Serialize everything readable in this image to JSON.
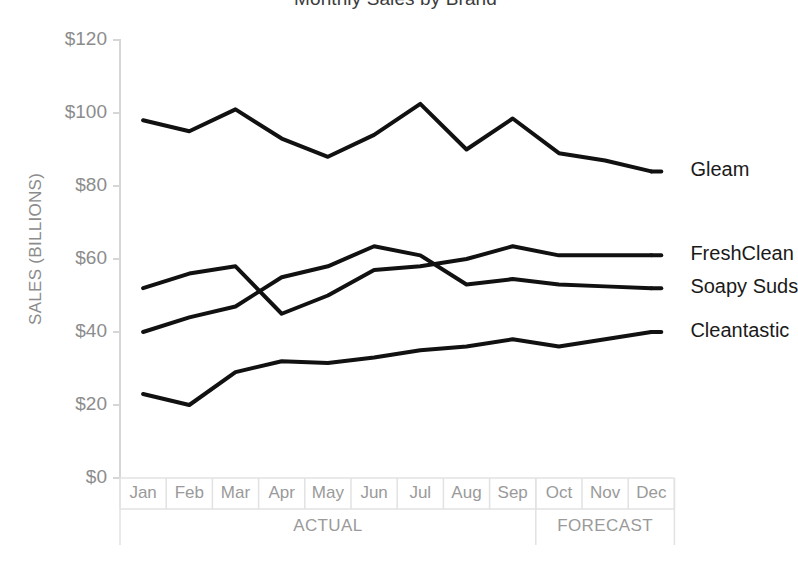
{
  "chart_data": {
    "type": "line",
    "title": "Monthly Sales by Brand",
    "xlabel": "",
    "ylabel": "SALES (BILLIONS)",
    "ylim": [
      0,
      120
    ],
    "ytick_labels": [
      "$0",
      "$20",
      "$40",
      "$60",
      "$80",
      "$100",
      "$120"
    ],
    "ytick_values": [
      0,
      20,
      40,
      60,
      80,
      100,
      120
    ],
    "grid": false,
    "legend_position": "right-inline",
    "categories": [
      "Jan",
      "Feb",
      "Mar",
      "Apr",
      "May",
      "Jun",
      "Jul",
      "Aug",
      "Sep",
      "Oct",
      "Nov",
      "Dec"
    ],
    "groups": [
      {
        "label": "ACTUAL",
        "start": 0,
        "end": 8
      },
      {
        "label": "FORECAST",
        "start": 9,
        "end": 11
      }
    ],
    "series": [
      {
        "name": "Gleam",
        "values": [
          98,
          95,
          101,
          93,
          88,
          94,
          102.5,
          90,
          98.5,
          89,
          87,
          84
        ]
      },
      {
        "name": "FreshClean",
        "values": [
          52,
          56,
          58,
          45,
          50,
          57,
          58,
          60,
          63.5,
          61,
          61,
          61
        ]
      },
      {
        "name": "Soapy Suds",
        "values": [
          40,
          44,
          47,
          55,
          58,
          63.5,
          61,
          53,
          54.5,
          53,
          52.5,
          52
        ]
      },
      {
        "name": "Cleantastic",
        "values": [
          23,
          20,
          29,
          32,
          31.5,
          33,
          35,
          36,
          38,
          36,
          38,
          40
        ]
      }
    ],
    "line_color": "#111111"
  },
  "axis": {
    "axis_color": "#d6d6d6",
    "label_color": "#9a9a9a"
  }
}
